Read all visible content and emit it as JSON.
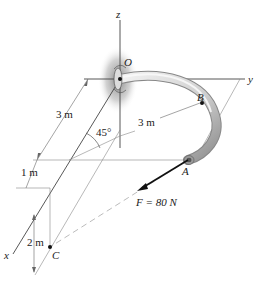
{
  "diagram": {
    "type": "statics-3d-pipe",
    "axes": {
      "x": "x",
      "y": "y",
      "z": "z"
    },
    "points": {
      "origin": "O",
      "b": "B",
      "a": "A",
      "c": "C"
    },
    "dimensions": {
      "radius_arc": "3 m",
      "ox_length": "3 m",
      "offset_1": "1 m",
      "height_c": "2 m",
      "angle": "45°"
    },
    "force": {
      "label": "F = 80 N",
      "magnitude": 80,
      "unit": "N"
    },
    "colors": {
      "line": "#333333",
      "thin_line": "#888888",
      "pipe_light": "#e6e6e6",
      "pipe_dark": "#9a9a9a",
      "shadow": "#7a7a7a",
      "dash": "#aaaaaa"
    }
  }
}
